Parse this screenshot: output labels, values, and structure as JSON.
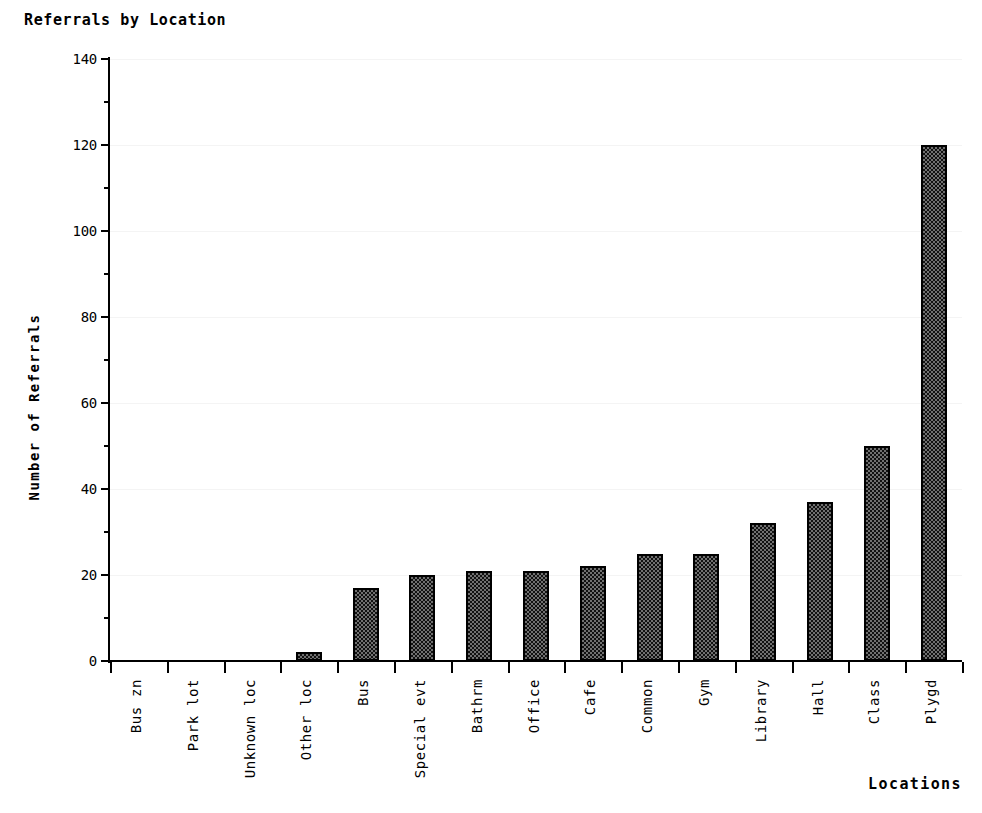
{
  "chart_data": {
    "type": "bar",
    "title": "Referrals by Location",
    "xlabel": "Locations",
    "ylabel": "Number of Referrals",
    "categories": [
      "Bus zn",
      "Park lot",
      "Unknown loc",
      "Other loc",
      "Bus",
      "Special evt",
      "Bathrm",
      "Office",
      "Cafe",
      "Common",
      "Gym",
      "Library",
      "Hall",
      "Class",
      "Plygd"
    ],
    "values": [
      0,
      0,
      0,
      2,
      17,
      20,
      21,
      21,
      22,
      25,
      25,
      32,
      37,
      50,
      120
    ],
    "ylim": [
      0,
      140
    ],
    "ytick_labels": [
      "0",
      "20",
      "40",
      "60",
      "80",
      "100",
      "120",
      "140"
    ],
    "ytick_values": [
      0,
      20,
      40,
      60,
      80,
      100,
      120,
      140
    ],
    "yminor_values": [
      10,
      30,
      50,
      70,
      90,
      110,
      130
    ],
    "grid": true,
    "legend": "none",
    "bar_fill_color": "#4a4a4a",
    "bar_edge_color": "#000000",
    "background_color": "#ffffff"
  }
}
